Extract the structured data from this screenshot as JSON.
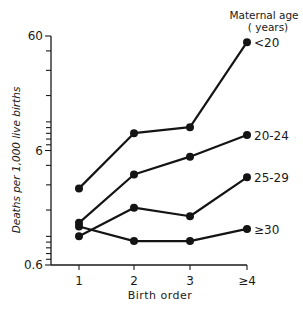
{
  "chart_data": {
    "type": "line",
    "title": "",
    "xlabel": "Birth order",
    "ylabel": "Deaths per 1,000 live births",
    "categories": [
      "1",
      "2",
      "3",
      "≥4"
    ],
    "yscale": "log",
    "ylim": [
      0.6,
      60
    ],
    "yticks": [
      0.6,
      6,
      60
    ],
    "ytick_labels": [
      "0.6",
      "6",
      "60"
    ],
    "grid": false,
    "legend": {
      "title_line1": "Maternal age",
      "title_line2": "( years)",
      "placement": "right, labels at line ends"
    },
    "series": [
      {
        "name": "<20",
        "values": [
          2.8,
          8.5,
          9.6,
          53
        ]
      },
      {
        "name": "20-24",
        "values": [
          1.4,
          3.7,
          5.3,
          8.2
        ]
      },
      {
        "name": "25-29",
        "values": [
          1.07,
          1.9,
          1.6,
          3.5
        ]
      },
      {
        "name": "≥30",
        "values": [
          1.3,
          0.97,
          0.97,
          1.24
        ]
      }
    ]
  }
}
